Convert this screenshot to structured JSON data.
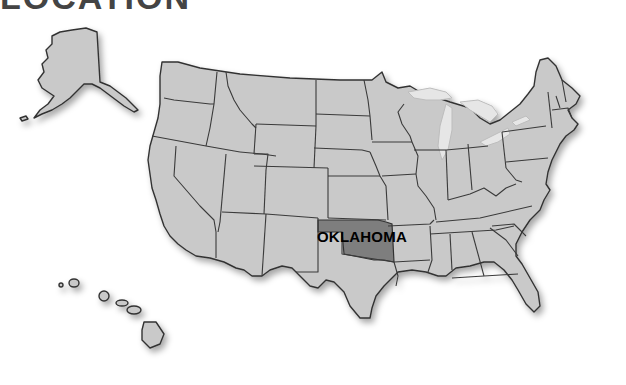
{
  "heading": "LOCATION",
  "map": {
    "title": "United States",
    "highlighted_state": {
      "name": "Oklahoma",
      "label": "OKLAHOMA",
      "fill_color": "#7e7e7e"
    },
    "base_fill_color": "#c9c9c9",
    "border_color": "#333333",
    "lake_color": "#e6e6e6",
    "insets": [
      "Alaska",
      "Hawaii"
    ]
  }
}
